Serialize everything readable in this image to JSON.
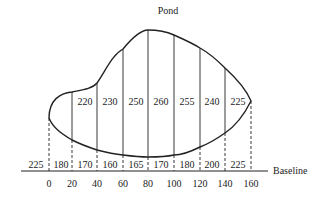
{
  "title": "Pond",
  "baseline_label": "Baseline",
  "colors": {
    "ink": "#222222",
    "background": "#ffffff"
  },
  "offsets": {
    "stations": [
      0,
      20,
      40,
      60,
      80,
      100,
      120,
      140,
      160
    ],
    "top_offsets": [
      {
        "from": 20,
        "to": 40,
        "value": "220"
      },
      {
        "from": 40,
        "to": 60,
        "value": "230"
      },
      {
        "from": 60,
        "to": 80,
        "value": "250"
      },
      {
        "from": 80,
        "to": 100,
        "value": "260"
      },
      {
        "from": 100,
        "to": 120,
        "value": "255"
      },
      {
        "from": 120,
        "to": 140,
        "value": "240"
      },
      {
        "from": 140,
        "to": 160,
        "value": "225"
      }
    ],
    "bottom_offsets": [
      {
        "segment": "left of 0",
        "value": "225"
      },
      {
        "from": 0,
        "to": 20,
        "value": "180"
      },
      {
        "from": 20,
        "to": 40,
        "value": "170"
      },
      {
        "from": 40,
        "to": 60,
        "value": "160"
      },
      {
        "from": 60,
        "to": 80,
        "value": "165"
      },
      {
        "from": 80,
        "to": 100,
        "value": "170"
      },
      {
        "from": 100,
        "to": 120,
        "value": "180"
      },
      {
        "from": 120,
        "to": 140,
        "value": "200"
      },
      {
        "from": 140,
        "to": 160,
        "value": "225"
      }
    ]
  },
  "labels": {
    "ticks": [
      "0",
      "20",
      "40",
      "60",
      "80",
      "100",
      "120",
      "140",
      "160"
    ],
    "top": [
      "220",
      "230",
      "250",
      "260",
      "255",
      "240",
      "225"
    ],
    "bottom": [
      "225",
      "180",
      "170",
      "160",
      "165",
      "170",
      "180",
      "200",
      "225"
    ]
  }
}
